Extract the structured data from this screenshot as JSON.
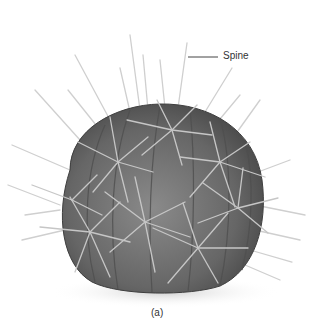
{
  "figure": {
    "labels": [
      {
        "text": "Spine",
        "x": 223,
        "y": 51,
        "leader": {
          "x1": 188,
          "x2": 218,
          "y": 57
        }
      }
    ],
    "caption": "(a)",
    "colors": {
      "background": "#ffffff",
      "body": "#6e6e6e",
      "body_dark": "#4a4a4a",
      "body_light": "#8c8c8c",
      "spine": "#c8c8c8",
      "label": "#333333"
    }
  }
}
